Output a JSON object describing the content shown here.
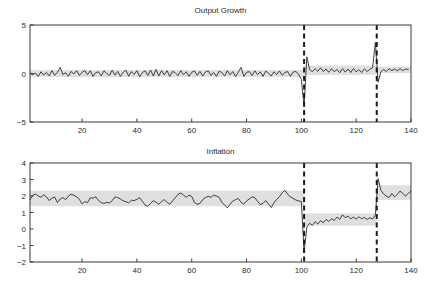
{
  "figure": {
    "width": 431,
    "height": 291,
    "background": "#ffffff",
    "line_color": "#2e2e2e",
    "band_color": "#d9d9d9",
    "break_color": "#1a1a1a"
  },
  "chart_data": [
    {
      "type": "line",
      "panel": "top",
      "title": "Output Growth",
      "xlabel": "",
      "ylabel": "",
      "xlim": [
        1,
        140
      ],
      "ylim": [
        -5,
        5
      ],
      "grid": false,
      "legend": "none",
      "xticks": [
        20,
        40,
        60,
        80,
        100,
        120,
        140
      ],
      "yticks": [
        -5,
        0,
        5
      ],
      "annotations": [
        {
          "type": "vertical-dashed-line",
          "x": 101,
          "label": "regime-break-1"
        },
        {
          "type": "vertical-dashed-line",
          "x": 127.5,
          "label": "regime-break-2"
        }
      ],
      "x": [
        1,
        2,
        3,
        4,
        5,
        6,
        7,
        8,
        9,
        10,
        11,
        12,
        13,
        14,
        15,
        16,
        17,
        18,
        19,
        20,
        21,
        22,
        23,
        24,
        25,
        26,
        27,
        28,
        29,
        30,
        31,
        32,
        33,
        34,
        35,
        36,
        37,
        38,
        39,
        40,
        41,
        42,
        43,
        44,
        45,
        46,
        47,
        48,
        49,
        50,
        51,
        52,
        53,
        54,
        55,
        56,
        57,
        58,
        59,
        60,
        61,
        62,
        63,
        64,
        65,
        66,
        67,
        68,
        69,
        70,
        71,
        72,
        73,
        74,
        75,
        76,
        77,
        78,
        79,
        80,
        81,
        82,
        83,
        84,
        85,
        86,
        87,
        88,
        89,
        90,
        91,
        92,
        93,
        94,
        95,
        96,
        97,
        98,
        99,
        100,
        101,
        102,
        103,
        104,
        105,
        106,
        107,
        108,
        109,
        110,
        111,
        112,
        113,
        114,
        115,
        116,
        117,
        118,
        119,
        120,
        121,
        122,
        123,
        124,
        125,
        126,
        127,
        128,
        129,
        130,
        131,
        132,
        133,
        134,
        135,
        136,
        137,
        138,
        139,
        140
      ],
      "series": [
        {
          "name": "Output growth",
          "values": [
            0.02,
            -0.12,
            0.05,
            -0.3,
            0.18,
            -0.16,
            0.1,
            -0.24,
            0.3,
            -0.18,
            0.12,
            0.62,
            -0.1,
            0.08,
            -0.28,
            0.22,
            -0.06,
            0.3,
            -0.2,
            0.12,
            0.3,
            -0.12,
            0.28,
            -0.3,
            0.1,
            0.16,
            -0.24,
            0.28,
            0.0,
            -0.2,
            0.34,
            -0.16,
            0.22,
            -0.3,
            0.14,
            0.34,
            -0.28,
            0.2,
            -0.1,
            0.3,
            -0.34,
            0.1,
            0.28,
            -0.2,
            0.36,
            -0.26,
            0.42,
            -0.24,
            0.3,
            -0.14,
            0.28,
            -0.3,
            0.22,
            0.08,
            -0.22,
            0.3,
            -0.12,
            0.18,
            -0.28,
            0.12,
            0.26,
            -0.18,
            0.22,
            -0.26,
            0.16,
            0.28,
            -0.2,
            0.1,
            -0.3,
            0.24,
            0.1,
            -0.26,
            0.3,
            -0.14,
            0.2,
            -0.32,
            0.14,
            0.64,
            -0.3,
            0.12,
            0.2,
            -0.22,
            0.28,
            -0.12,
            0.18,
            -0.3,
            0.24,
            0.06,
            -0.26,
            0.18,
            -0.1,
            0.26,
            -0.18,
            0.1,
            0.2,
            -0.3,
            0.14,
            0.22,
            -0.1,
            -0.62,
            -3.45,
            1.72,
            0.42,
            0.18,
            0.5,
            0.22,
            0.58,
            0.2,
            0.46,
            0.12,
            0.5,
            0.18,
            0.42,
            0.08,
            0.5,
            0.14,
            0.46,
            0.1,
            0.52,
            0.16,
            0.4,
            0.1,
            0.48,
            0.2,
            0.44,
            0.6,
            3.2,
            -0.9,
            0.18,
            0.42,
            0.22,
            0.48,
            0.3,
            0.46,
            0.28,
            0.5,
            0.3,
            0.46,
            0.42
          ]
        }
      ],
      "bands": [
        {
          "name": "confidence-band-regime-1",
          "x_start": 1,
          "x_end": 101,
          "upper": 0.36,
          "lower": -0.36
        },
        {
          "name": "confidence-band-regime-2",
          "x_start": 101,
          "x_end": 127.5,
          "upper": 0.82,
          "lower": -0.15
        },
        {
          "name": "confidence-band-regime-3",
          "x_start": 127.5,
          "x_end": 140,
          "upper": 0.7,
          "lower": 0.05
        }
      ]
    },
    {
      "type": "line",
      "panel": "bottom",
      "title": "Inflation",
      "xlabel": "",
      "ylabel": "",
      "xlim": [
        1,
        140
      ],
      "ylim": [
        -2,
        4
      ],
      "grid": false,
      "legend": "none",
      "xticks": [
        20,
        40,
        60,
        80,
        100,
        120,
        140
      ],
      "yticks": [
        -2,
        -1,
        0,
        1,
        2,
        3,
        4
      ],
      "annotations": [
        {
          "type": "vertical-dashed-line",
          "x": 101,
          "label": "regime-break-1"
        },
        {
          "type": "vertical-dashed-line",
          "x": 127.5,
          "label": "regime-break-2"
        }
      ],
      "x": [
        1,
        2,
        3,
        4,
        5,
        6,
        7,
        8,
        9,
        10,
        11,
        12,
        13,
        14,
        15,
        16,
        17,
        18,
        19,
        20,
        21,
        22,
        23,
        24,
        25,
        26,
        27,
        28,
        29,
        30,
        31,
        32,
        33,
        34,
        35,
        36,
        37,
        38,
        39,
        40,
        41,
        42,
        43,
        44,
        45,
        46,
        47,
        48,
        49,
        50,
        51,
        52,
        53,
        54,
        55,
        56,
        57,
        58,
        59,
        60,
        61,
        62,
        63,
        64,
        65,
        66,
        67,
        68,
        69,
        70,
        71,
        72,
        73,
        74,
        75,
        76,
        77,
        78,
        79,
        80,
        81,
        82,
        83,
        84,
        85,
        86,
        87,
        88,
        89,
        90,
        91,
        92,
        93,
        94,
        95,
        96,
        97,
        98,
        99,
        100,
        101,
        102,
        103,
        104,
        105,
        106,
        107,
        108,
        109,
        110,
        111,
        112,
        113,
        114,
        115,
        116,
        117,
        118,
        119,
        120,
        121,
        122,
        123,
        124,
        125,
        126,
        127,
        128,
        129,
        130,
        131,
        132,
        133,
        134,
        135,
        136,
        137,
        138,
        139,
        140
      ],
      "series": [
        {
          "name": "Inflation",
          "values": [
            1.78,
            2.05,
            2.12,
            2.0,
            1.92,
            2.08,
            1.95,
            1.72,
            1.86,
            1.94,
            1.6,
            1.82,
            1.9,
            1.78,
            2.0,
            2.1,
            2.05,
            1.95,
            1.8,
            1.52,
            1.66,
            1.6,
            1.9,
            1.86,
            1.95,
            1.72,
            1.6,
            1.55,
            1.62,
            1.58,
            1.72,
            1.95,
            1.9,
            1.82,
            1.7,
            1.66,
            1.58,
            1.74,
            1.72,
            1.8,
            1.9,
            1.68,
            1.45,
            1.38,
            1.55,
            1.72,
            1.62,
            1.5,
            1.66,
            1.78,
            1.62,
            1.5,
            1.7,
            1.9,
            2.1,
            2.18,
            2.05,
            1.92,
            2.05,
            1.98,
            1.6,
            1.5,
            1.55,
            1.78,
            1.9,
            1.98,
            1.92,
            2.05,
            2.0,
            1.92,
            1.62,
            1.45,
            1.28,
            1.5,
            1.7,
            1.78,
            1.85,
            1.62,
            1.5,
            1.7,
            1.82,
            1.95,
            1.9,
            1.68,
            1.48,
            1.55,
            1.72,
            1.52,
            1.3,
            1.58,
            1.8,
            1.95,
            2.2,
            2.35,
            2.1,
            1.95,
            1.85,
            1.76,
            1.7,
            1.66,
            -1.42,
            0.12,
            0.35,
            0.22,
            0.45,
            0.3,
            0.5,
            0.38,
            0.58,
            0.46,
            0.62,
            0.52,
            0.72,
            0.58,
            0.86,
            0.68,
            0.78,
            0.62,
            0.72,
            0.6,
            0.74,
            0.62,
            0.7,
            0.58,
            0.68,
            0.6,
            0.85,
            3.05,
            2.35,
            2.12,
            2.0,
            1.9,
            2.15,
            1.95,
            2.1,
            2.3,
            2.15,
            2.0,
            2.15,
            2.3
          ]
        }
      ],
      "bands": [
        {
          "name": "confidence-band-regime-1",
          "x_start": 1,
          "x_end": 101,
          "upper": 2.32,
          "lower": 1.38
        },
        {
          "name": "confidence-band-regime-2",
          "x_start": 101,
          "x_end": 127.5,
          "upper": 0.95,
          "lower": 0.2
        },
        {
          "name": "confidence-band-regime-3",
          "x_start": 127.5,
          "x_end": 140,
          "upper": 2.65,
          "lower": 1.75
        }
      ]
    }
  ]
}
